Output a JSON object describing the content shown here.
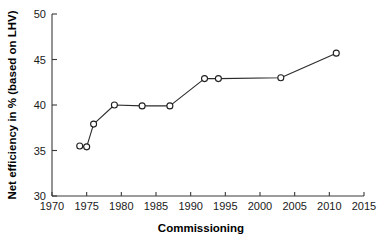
{
  "chart_data": {
    "type": "line",
    "title": "",
    "xlabel": "Commissioning",
    "ylabel": "Net efficiency in % (based on LHV)",
    "xlim": [
      1970,
      2015
    ],
    "ylim": [
      30,
      50
    ],
    "xticks": [
      1970,
      1975,
      1980,
      1985,
      1990,
      1995,
      2000,
      2005,
      2010,
      2015
    ],
    "yticks": [
      30,
      35,
      40,
      45,
      50
    ],
    "grid": false,
    "legend": "none",
    "marker": "open-circle",
    "series": [
      {
        "name": "Net efficiency",
        "x": [
          1974,
          1975,
          1976,
          1979,
          1983,
          1987,
          1992,
          1994,
          2003,
          2011
        ],
        "values": [
          35.5,
          35.4,
          37.9,
          40.0,
          39.9,
          39.9,
          42.9,
          42.9,
          43.0,
          45.7
        ]
      }
    ],
    "line_color": "#2b2b2b",
    "marker_fill": "#ffffff",
    "marker_edge": "#1f1f1f",
    "axis_color": "#3a3a3a",
    "background": "#ffffff"
  }
}
